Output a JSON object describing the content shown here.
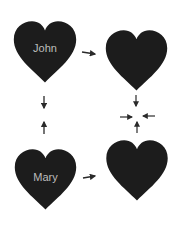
{
  "diagram": {
    "colors": {
      "heart": "#1c1c1c",
      "label": "#c4c4c4",
      "arrow": "#2a2a2a",
      "background": "#ffffff"
    },
    "hearts": [
      {
        "id": "john",
        "label": "John"
      },
      {
        "id": "top-right",
        "label": ""
      },
      {
        "id": "mary",
        "label": "Mary"
      },
      {
        "id": "bottom-right",
        "label": ""
      }
    ],
    "arrows": [
      {
        "from": "john",
        "to": "top-right",
        "direction": "right"
      },
      {
        "from": "john",
        "to": "mary",
        "direction": "down"
      },
      {
        "from": "mary",
        "to": "john",
        "direction": "up"
      },
      {
        "from": "mary",
        "to": "bottom-right",
        "direction": "right"
      },
      {
        "from": "top-right",
        "to": "center",
        "direction": "down"
      },
      {
        "from": "bottom-right",
        "to": "center",
        "direction": "up"
      },
      {
        "from": "left",
        "to": "center",
        "direction": "right"
      },
      {
        "from": "right",
        "to": "center",
        "direction": "left"
      }
    ]
  }
}
